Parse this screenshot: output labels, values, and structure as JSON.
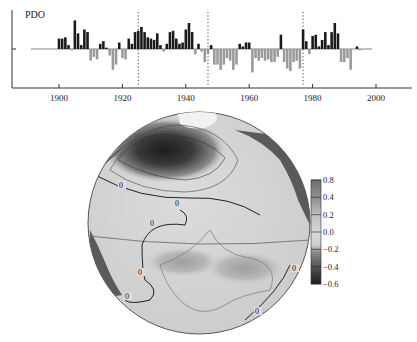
{
  "chart_data": [
    {
      "type": "bar",
      "title": "PDO",
      "xlabel": "",
      "ylabel": "",
      "xlim": [
        1887,
        2010
      ],
      "ylim": [
        -3,
        3
      ],
      "x_ticks": [
        1900,
        1920,
        1940,
        1960,
        1980,
        2000
      ],
      "positive_color": "#1a1a1a",
      "negative_color": "#9a9a9a",
      "regime_shift_lines": [
        1925,
        1947,
        1977
      ],
      "years": [
        1900,
        1901,
        1902,
        1903,
        1904,
        1905,
        1906,
        1907,
        1908,
        1909,
        1910,
        1911,
        1912,
        1913,
        1914,
        1915,
        1916,
        1917,
        1918,
        1919,
        1920,
        1921,
        1922,
        1923,
        1924,
        1925,
        1926,
        1927,
        1928,
        1929,
        1930,
        1931,
        1932,
        1933,
        1934,
        1935,
        1936,
        1937,
        1938,
        1939,
        1940,
        1941,
        1942,
        1943,
        1944,
        1945,
        1946,
        1947,
        1948,
        1949,
        1950,
        1951,
        1952,
        1953,
        1954,
        1955,
        1956,
        1957,
        1958,
        1959,
        1960,
        1961,
        1962,
        1963,
        1964,
        1965,
        1966,
        1967,
        1968,
        1969,
        1970,
        1971,
        1972,
        1973,
        1974,
        1975,
        1976,
        1977,
        1978,
        1979,
        1980,
        1981,
        1982,
        1983,
        1984,
        1985,
        1986,
        1987,
        1988,
        1989,
        1990,
        1991,
        1992,
        1993,
        1994,
        1995
      ],
      "values": [
        0.8,
        0.8,
        0.9,
        0.3,
        -0.1,
        2.2,
        1.2,
        0.3,
        1.5,
        1.3,
        -0.9,
        -0.6,
        -0.8,
        0.4,
        0.6,
        0.1,
        -0.5,
        -1.6,
        -1.2,
        0.5,
        -0.7,
        -0.8,
        0.8,
        0.4,
        1.3,
        1.4,
        1.7,
        1.3,
        0.9,
        0.8,
        0.7,
        1.2,
        0.3,
        -0.2,
        0.4,
        1.3,
        1.4,
        0.8,
        0.4,
        0.5,
        1.5,
        2.0,
        1.3,
        -0.4,
        0.4,
        -0.2,
        -1.0,
        -0.4,
        0.3,
        -1.2,
        -1.2,
        -1.6,
        -1.2,
        -0.7,
        -0.9,
        -1.6,
        -1.2,
        0.4,
        0.2,
        0.5,
        0.5,
        -1.8,
        -0.7,
        -0.9,
        -0.7,
        -0.9,
        -0.8,
        -1.0,
        -1.0,
        -0.6,
        1.1,
        -1.0,
        -1.5,
        -1.7,
        -1.0,
        -0.9,
        -1.5,
        1.5,
        0.6,
        -0.4,
        1.0,
        1.1,
        0.2,
        0.7,
        1.3,
        0.3,
        1.3,
        2.0,
        1.2,
        -1.0,
        -1.0,
        -0.7,
        -1.6,
        0.0,
        0.2,
        -0.1
      ]
    },
    {
      "type": "heatmap",
      "title": "",
      "description": "Orthographic globe centered on the Pacific Ocean showing SST regression on PDO index with contours",
      "contour_labels": [
        "0",
        "0",
        "0",
        "0",
        "0",
        "0",
        "0",
        "-0.2",
        "-0.4",
        "-0.6",
        "-0.4",
        "-0.2"
      ],
      "colorbar": {
        "ticks": [
          "0.8",
          "0.4",
          "0.2",
          "0.0",
          "−0.2",
          "−0.4",
          "−0.6"
        ],
        "values": [
          0.8,
          0.4,
          0.2,
          0.0,
          -0.2,
          -0.4,
          -0.6
        ],
        "colors": [
          "#6e6e6e",
          "#9a9a9a",
          "#bdbdbd",
          "#d4d4d4",
          "#cfcfcf",
          "#6a6a6a",
          "#2a2a2a"
        ]
      }
    }
  ],
  "top_chart": {
    "label": "PDO",
    "tick_labels": [
      "1900",
      "1920",
      "1940",
      "1960",
      "1980",
      "2000"
    ]
  },
  "colorbar": {
    "labels": [
      "0.8",
      "0.4",
      "0.2",
      "0.0",
      "−0.2",
      "−0.4",
      "−0.6"
    ]
  },
  "map": {
    "zero_labels": [
      "0",
      "0",
      "0",
      "0",
      "0",
      "0",
      "0"
    ]
  }
}
